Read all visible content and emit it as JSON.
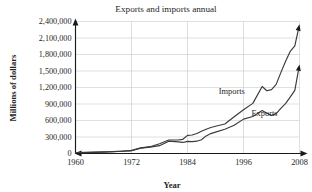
{
  "chart_data": {
    "type": "line",
    "title": "Exports and imports annual",
    "xlabel": "Year",
    "ylabel": "Millions of dollars",
    "grid": true,
    "legend": "inline-labels",
    "xlim": [
      1960,
      2008
    ],
    "ylim": [
      0,
      2400000
    ],
    "xticks": [
      1960,
      1972,
      1984,
      1996,
      2008
    ],
    "xtick_labels": [
      "1960",
      "1972",
      "1984",
      "1996",
      "2008"
    ],
    "yticks": [
      0,
      300000,
      600000,
      900000,
      1200000,
      1500000,
      1800000,
      2100000,
      2400000
    ],
    "ytick_labels": [
      "0",
      "300,000",
      "600,000",
      "900,000",
      "1,200,000",
      "1,500,000",
      "1,800,000",
      "2,100,000",
      "2,400,000"
    ],
    "x": [
      1960,
      1962,
      1964,
      1966,
      1968,
      1970,
      1972,
      1974,
      1976,
      1978,
      1980,
      1982,
      1983,
      1984,
      1985,
      1986,
      1987,
      1988,
      1989,
      1990,
      1992,
      1994,
      1996,
      1998,
      2000,
      2001,
      2002,
      2003,
      2004,
      2005,
      2006,
      2007,
      2008
    ],
    "series": [
      {
        "name": "Imports",
        "label": "Imports",
        "color": "#3a3a3a",
        "values": [
          15000,
          17000,
          20000,
          26000,
          33000,
          40000,
          56000,
          103000,
          124000,
          176000,
          245000,
          245000,
          258000,
          330000,
          336000,
          365000,
          406000,
          441000,
          473000,
          495000,
          536000,
          669000,
          795000,
          911000,
          1218000,
          1141000,
          1161000,
          1257000,
          1470000,
          1673000,
          1855000,
          1957000,
          2350000
        ]
      },
      {
        "name": "Exports",
        "label": "Exports",
        "color": "#3a3a3a",
        "values": [
          19000,
          21000,
          25000,
          30000,
          34000,
          42000,
          49000,
          98000,
          115000,
          142000,
          224000,
          212000,
          201000,
          220000,
          215000,
          224000,
          250000,
          320000,
          362000,
          389000,
          440000,
          512000,
          625000,
          672000,
          782000,
          731000,
          693000,
          725000,
          819000,
          907000,
          1026000,
          1149000,
          1620000
        ]
      }
    ],
    "annotations": [
      {
        "text": "Imports",
        "x": 1993.5,
        "y": 1085000
      },
      {
        "text": "Exports",
        "x": 2000.5,
        "y": 690000
      }
    ]
  }
}
